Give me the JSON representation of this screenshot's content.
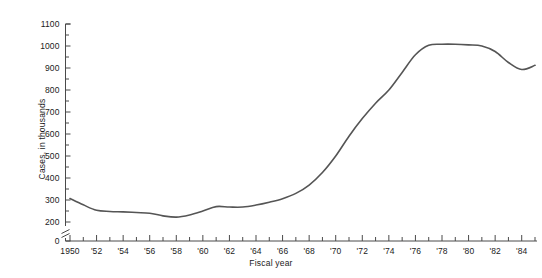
{
  "chart_data": {
    "type": "line",
    "title": "",
    "xlabel": "Fiscal year",
    "ylabel": "Cases, in thousands",
    "xlim": [
      1950,
      1985
    ],
    "ylim": [
      200,
      1100
    ],
    "y_axis_break": true,
    "y_axis_zero_label": "0",
    "grid": false,
    "legend": null,
    "y_ticks_major": [
      200,
      300,
      400,
      500,
      600,
      700,
      800,
      900,
      1000,
      1100
    ],
    "y_tick_labels": [
      "200",
      "300",
      "400",
      "500",
      "600",
      "700",
      "800",
      "900",
      "1000",
      "1100"
    ],
    "y_ticks_minor_step": 50,
    "x_ticks_major": [
      1950,
      1952,
      1954,
      1956,
      1958,
      1960,
      1962,
      1964,
      1966,
      1968,
      1970,
      1972,
      1974,
      1976,
      1978,
      1980,
      1982,
      1984
    ],
    "x_tick_labels": [
      "1950",
      "'52",
      "'54",
      "'56",
      "'58",
      "'60",
      "'62",
      "'64",
      "'66",
      "'68",
      "'70",
      "'72",
      "'74",
      "'76",
      "'78",
      "'80",
      "'82",
      "'84"
    ],
    "x_ticks_minor_step": 1,
    "series": [
      {
        "name": "Cases",
        "color": "#555555",
        "x": [
          1950,
          1951,
          1952,
          1953,
          1954,
          1955,
          1956,
          1957,
          1958,
          1959,
          1960,
          1961,
          1962,
          1963,
          1964,
          1965,
          1966,
          1967,
          1968,
          1969,
          1970,
          1971,
          1972,
          1973,
          1974,
          1975,
          1976,
          1977,
          1978,
          1979,
          1980,
          1981,
          1982,
          1983,
          1984,
          1985
        ],
        "values": [
          307,
          278,
          253,
          248,
          246,
          243,
          240,
          228,
          222,
          232,
          250,
          270,
          268,
          268,
          277,
          290,
          306,
          330,
          368,
          425,
          500,
          590,
          670,
          740,
          800,
          880,
          960,
          1003,
          1008,
          1008,
          1005,
          1000,
          975,
          925,
          893,
          912
        ]
      }
    ]
  },
  "axis": {
    "y_zero_tick": "0"
  }
}
